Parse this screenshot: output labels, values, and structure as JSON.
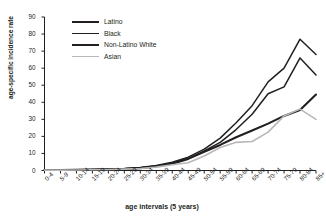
{
  "chart_data": {
    "type": "line",
    "title": "",
    "xlabel": "age intervals (5 years)",
    "ylabel": "age-specific incidence rate",
    "ylim": [
      0,
      90
    ],
    "ytick_step": 10,
    "grid": false,
    "legend_position": "top-left-inside",
    "categories": [
      "0-4",
      "5-9",
      "10-14",
      "15-19",
      "20-24",
      "25-29",
      "30-34",
      "35-39",
      "40-44",
      "45-49",
      "50-54",
      "55-59",
      "60-64",
      "65-69",
      "70-74",
      "75-79",
      "80-84",
      "85+"
    ],
    "ytick_labels": [
      "0",
      "10",
      "20",
      "30",
      "40",
      "50",
      "60",
      "70",
      "80",
      "90"
    ],
    "series": [
      {
        "name": "Latino",
        "color": "#231f20",
        "width": 1.5,
        "values": [
          0.3,
          0.3,
          0.4,
          0.5,
          0.8,
          1.0,
          1.6,
          2.6,
          4.2,
          7.0,
          11.5,
          16.5,
          24.0,
          33.0,
          45.0,
          49.0,
          66.0,
          56.0
        ]
      },
      {
        "name": "Black",
        "color": "#231f20",
        "width": 1.5,
        "values": [
          0.3,
          0.3,
          0.4,
          0.6,
          0.9,
          1.2,
          1.8,
          3.0,
          4.8,
          7.8,
          12.5,
          19.0,
          28.0,
          38.0,
          52.0,
          60.0,
          77.0,
          68.0
        ]
      },
      {
        "name": "Non-Latino White",
        "color": "#231f20",
        "width": 2.1,
        "values": [
          0.3,
          0.3,
          0.4,
          0.5,
          0.7,
          0.9,
          1.4,
          2.4,
          4.0,
          6.8,
          11.0,
          15.0,
          19.5,
          23.5,
          27.5,
          32.0,
          35.5,
          44.5
        ]
      },
      {
        "name": "Asian",
        "color": "#b8b8b8",
        "width": 1.6,
        "values": [
          0.2,
          0.2,
          0.3,
          0.4,
          0.6,
          0.8,
          1.2,
          2.0,
          3.4,
          4.5,
          8.5,
          13.5,
          16.5,
          17.0,
          22.5,
          32.0,
          36.0,
          30.0
        ]
      }
    ]
  },
  "legend": {
    "items": [
      {
        "label": "Latino"
      },
      {
        "label": "Black"
      },
      {
        "label": "Non-Latino White"
      },
      {
        "label": "Asian"
      }
    ]
  }
}
